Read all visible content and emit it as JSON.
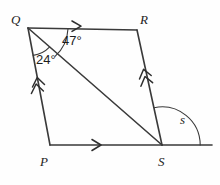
{
  "figure": {
    "kind": "geometry-diagram",
    "background_color": "#fefefe",
    "stroke_color": "#3a3a3a",
    "text_color": "#1d1d1d",
    "vertices": [
      {
        "name": "Q",
        "label": "Q",
        "x": 28,
        "y": 28,
        "label_x": 11,
        "label_y": 13
      },
      {
        "name": "R",
        "label": "R",
        "x": 137,
        "y": 30,
        "label_x": 140,
        "label_y": 13
      },
      {
        "name": "S",
        "label": "S",
        "x": 162,
        "y": 145,
        "label_x": 158,
        "label_y": 155
      },
      {
        "name": "P",
        "label": "P",
        "x": 50,
        "y": 145,
        "label_x": 40,
        "label_y": 155
      }
    ],
    "segments": [
      {
        "name": "QR",
        "from": "Q",
        "to": "R",
        "marks": 1
      },
      {
        "name": "RS",
        "from": "R",
        "to": "S",
        "marks": 2
      },
      {
        "name": "PS",
        "from": "P",
        "to": "S",
        "marks": 1
      },
      {
        "name": "QP",
        "from": "Q",
        "to": "P",
        "marks": 2
      },
      {
        "name": "QS",
        "from": "Q",
        "to": "S",
        "marks": 0
      }
    ],
    "ray": {
      "name": "S-extension",
      "from_x": 162,
      "from_y": 145,
      "to_x": 212,
      "to_y": 145
    },
    "angles": [
      {
        "name": "angle-RQS",
        "label": "47°",
        "value": 47,
        "unit": "degrees",
        "at": "Q",
        "label_x": 62,
        "label_y": 34
      },
      {
        "name": "angle-SQP",
        "label": "24°",
        "value": 24,
        "unit": "degrees",
        "at": "Q",
        "label_x": 36,
        "label_y": 53
      },
      {
        "name": "angle-s-exterior",
        "label": "s",
        "value": null,
        "unit": "variable",
        "at": "S",
        "label_x": 180,
        "label_y": 113
      }
    ],
    "parallel_pairs": [
      {
        "a": "QR",
        "b": "PS",
        "marks": 1
      },
      {
        "a": "QP",
        "b": "RS",
        "marks": 2
      }
    ]
  }
}
